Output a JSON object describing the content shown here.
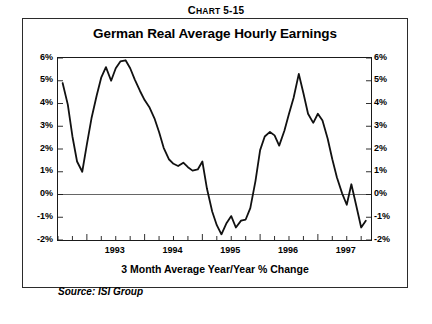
{
  "header": {
    "chart_label_lead": "C",
    "chart_label_rest": "HART",
    "chart_number": "5-15",
    "chart_label_full": "Chart 5-15"
  },
  "figure": {
    "title": "German Real Average Hourly Earnings",
    "subtitle": "3 Month Average Year/Year % Change",
    "source": "Source: ISI Group"
  },
  "chart_data": {
    "type": "line",
    "title": "German Real Average Hourly Earnings",
    "subtitle": "3 Month Average Year/Year % Change",
    "xlabel": "",
    "ylabel": "",
    "ylim": [
      -2,
      6
    ],
    "xlim": [
      1992.5,
      1997.92
    ],
    "grid": false,
    "legend": null,
    "y_tick_labels": [
      "6%",
      "5%",
      "4%",
      "3%",
      "2%",
      "1%",
      "0%",
      "-1%",
      "-2%"
    ],
    "y_ticks": [
      6,
      5,
      4,
      3,
      2,
      1,
      0,
      -1,
      -2
    ],
    "y_axis_right_mirrored": true,
    "x_tick_labels": [
      "1993",
      "1994",
      "1995",
      "1996",
      "1997"
    ],
    "x_ticks": [
      1993.0,
      1994.0,
      1995.0,
      1996.0,
      1997.0
    ],
    "x_minor_tick_interval_months": 3,
    "zero_line": 0,
    "line_color": "#111111",
    "line_width": 1.8,
    "series": [
      {
        "name": "German Real Average Hourly Earnings",
        "x": [
          1992.58,
          1992.67,
          1992.75,
          1992.83,
          1992.92,
          1993.0,
          1993.08,
          1993.17,
          1993.25,
          1993.33,
          1993.42,
          1993.5,
          1993.58,
          1993.67,
          1993.75,
          1993.83,
          1993.92,
          1994.0,
          1994.08,
          1994.17,
          1994.25,
          1994.33,
          1994.42,
          1994.5,
          1994.58,
          1994.67,
          1994.75,
          1994.83,
          1994.92,
          1995.0,
          1995.08,
          1995.17,
          1995.25,
          1995.33,
          1995.42,
          1995.5,
          1995.58,
          1995.67,
          1995.75,
          1995.83,
          1995.92,
          1996.0,
          1996.08,
          1996.17,
          1996.25,
          1996.33,
          1996.42,
          1996.5,
          1996.58,
          1996.67,
          1996.75,
          1996.83,
          1996.92,
          1997.0,
          1997.08,
          1997.17,
          1997.25,
          1997.33,
          1997.42,
          1997.5,
          1997.58,
          1997.67,
          1997.75,
          1997.83
        ],
        "y": [
          4.9,
          3.95,
          2.55,
          1.45,
          1.0,
          2.2,
          3.35,
          4.35,
          5.15,
          5.6,
          5.0,
          5.55,
          5.85,
          5.9,
          5.55,
          5.05,
          4.55,
          4.15,
          3.85,
          3.35,
          2.75,
          2.05,
          1.55,
          1.35,
          1.25,
          1.4,
          1.2,
          1.05,
          1.1,
          1.45,
          0.25,
          -0.75,
          -1.35,
          -1.75,
          -1.25,
          -0.95,
          -1.45,
          -1.15,
          -1.1,
          -0.6,
          0.6,
          1.95,
          2.55,
          2.75,
          2.6,
          2.15,
          2.8,
          3.55,
          4.25,
          5.3,
          4.45,
          3.55,
          3.15,
          3.55,
          3.25,
          2.45,
          1.55,
          0.75,
          0.05,
          -0.45,
          0.45,
          -0.55,
          -1.45,
          -1.15
        ]
      }
    ]
  }
}
